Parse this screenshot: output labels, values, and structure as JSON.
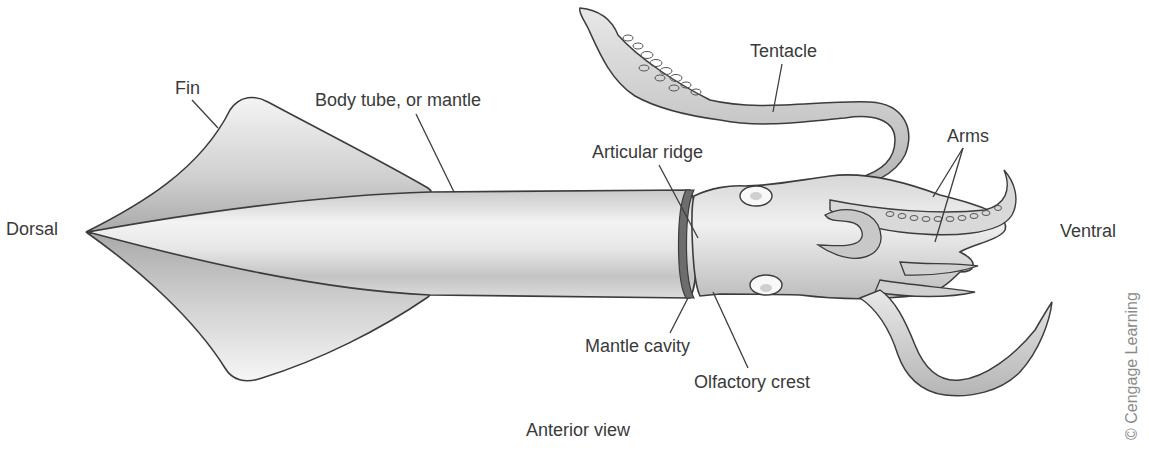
{
  "figure": {
    "caption": "Anterior view",
    "credit": "© Cengage Learning",
    "orientation": {
      "left": "Dorsal",
      "right": "Ventral"
    }
  },
  "labels": {
    "fin": "Fin",
    "body_tube": "Body tube, or mantle",
    "tentacle": "Tentacle",
    "articular_ridge": "Articular ridge",
    "arms": "Arms",
    "mantle_cavity": "Mantle cavity",
    "olfactory_crest": "Olfactory crest"
  },
  "colors": {
    "background": "#ffffff",
    "outline": "#3c3c3c",
    "label_text": "#3a3a3a",
    "credit_text": "#8a8a8a",
    "body_light": "#f2f2f2",
    "body_shade": "#b8b8b8"
  }
}
